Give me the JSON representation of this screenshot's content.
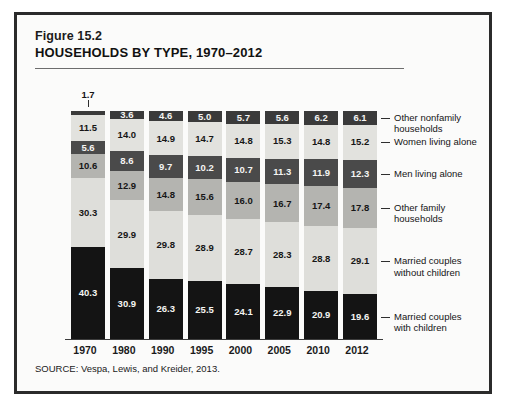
{
  "figure": {
    "number": "Figure 15.2",
    "title": "HOUSEHOLDS BY TYPE, 1970–2012",
    "source": "SOURCE: Vespa, Lewis, and Kreider, 2013."
  },
  "callout": {
    "year": "1970",
    "value": "1.7"
  },
  "chart_data": {
    "type": "bar",
    "stacked": true,
    "normalized": true,
    "title": "HOUSEHOLDS BY TYPE, 1970–2012",
    "subtitle": "Figure 15.2",
    "xlabel": "",
    "ylabel": "",
    "ylim": [
      0,
      100
    ],
    "grid": false,
    "legend_position": "right",
    "units": "percent of households",
    "categories": [
      "1970",
      "1980",
      "1990",
      "1995",
      "2000",
      "2005",
      "2010",
      "2012"
    ],
    "series": [
      {
        "name": "Other nonfamily households",
        "color": "#3a3a3a",
        "text_color": "light",
        "values": [
          1.7,
          3.6,
          4.6,
          5.0,
          5.7,
          5.6,
          6.2,
          6.1
        ],
        "labels": [
          "1.7",
          "3.6",
          "4.6",
          "5.0",
          "5.7",
          "5.6",
          "6.2",
          "6.1"
        ],
        "first_label_outside": true
      },
      {
        "name": "Women living alone",
        "color": "#e2e2de",
        "text_color": "dark",
        "values": [
          11.5,
          14.0,
          14.9,
          14.7,
          14.8,
          15.3,
          14.8,
          15.2
        ],
        "labels": [
          "11.5",
          "14.0",
          "14.9",
          "14.7",
          "14.8",
          "15.3",
          "14.8",
          "15.2"
        ]
      },
      {
        "name": "Men living alone",
        "color": "#4a4a4a",
        "text_color": "light",
        "values": [
          5.6,
          8.6,
          9.7,
          10.2,
          10.7,
          11.3,
          11.9,
          12.3
        ],
        "labels": [
          "5.6",
          "8.6",
          "9.7",
          "10.2",
          "10.7",
          "11.3",
          "11.9",
          "12.3"
        ]
      },
      {
        "name": "Other family households",
        "color": "#b4b4b0",
        "text_color": "dark",
        "values": [
          10.6,
          12.9,
          14.8,
          15.6,
          16.0,
          16.7,
          17.4,
          17.8
        ],
        "labels": [
          "10.6",
          "12.9",
          "14.8",
          "15.6",
          "16.0",
          "16.7",
          "17.4",
          "17.8"
        ]
      },
      {
        "name": "Married couples without children",
        "color": "#dededa",
        "text_color": "dark",
        "values": [
          30.3,
          29.9,
          29.8,
          28.9,
          28.7,
          28.3,
          28.8,
          29.1
        ],
        "labels": [
          "30.3",
          "29.9",
          "29.8",
          "28.9",
          "28.7",
          "28.3",
          "28.8",
          "29.1"
        ]
      },
      {
        "name": "Married couples with children",
        "color": "#141414",
        "text_color": "light",
        "values": [
          40.3,
          30.9,
          26.3,
          25.5,
          24.1,
          22.9,
          20.9,
          19.6
        ],
        "labels": [
          "40.3",
          "30.9",
          "26.3",
          "25.5",
          "24.1",
          "22.9",
          "20.9",
          "19.6"
        ]
      }
    ],
    "legend": [
      "Other nonfamily households",
      "Women living alone",
      "Men living alone",
      "Other family households",
      "Married couples without children",
      "Married couples with children"
    ]
  }
}
